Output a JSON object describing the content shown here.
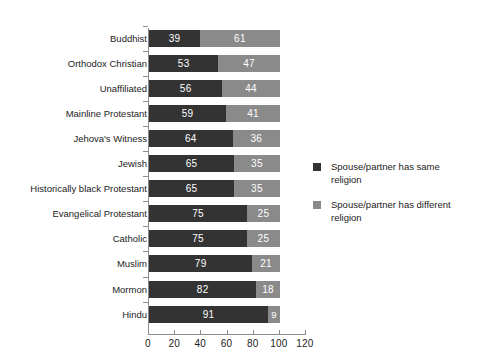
{
  "chart_data": {
    "type": "bar",
    "subtype": "stacked-horizontal-100pct",
    "title": "",
    "subtitle": "",
    "xlabel": "",
    "ylabel": "",
    "xlim": [
      0,
      120
    ],
    "xticks": [
      0,
      20,
      40,
      60,
      80,
      100,
      120
    ],
    "xtick_labels": [
      "0",
      "20",
      "40",
      "60",
      "80",
      "100",
      "120"
    ],
    "grid": false,
    "legend_position": "right",
    "categories": [
      "Buddhist",
      "Orthodox Christian",
      "Unaffiliated",
      "Mainline Protestant",
      "Jehova's Witness",
      "Jewish",
      "Historically black Protestant",
      "Evangelical Protestant",
      "Catholic",
      "Muslim",
      "Mormon",
      "Hindu"
    ],
    "series": [
      {
        "name": "Spouse/partner has same religion",
        "color": "#333333",
        "values": [
          39,
          53,
          56,
          59,
          64,
          65,
          65,
          75,
          75,
          79,
          82,
          91
        ]
      },
      {
        "name": "Spouse/partner has different religion",
        "color": "#8a8a8a",
        "values": [
          61,
          47,
          44,
          41,
          36,
          35,
          35,
          25,
          25,
          21,
          18,
          9
        ]
      }
    ]
  },
  "legend": {
    "items": [
      {
        "label": "Spouse/partner has same religion",
        "swatch": "same"
      },
      {
        "label": "Spouse/partner has different religion",
        "swatch": "diff"
      }
    ]
  },
  "colors": {
    "same": "#333333",
    "different": "#8a8a8a",
    "axis": "#8d8d8d",
    "text": "#1c1c1c",
    "value_text": "#ffffff",
    "background": "#ffffff"
  }
}
